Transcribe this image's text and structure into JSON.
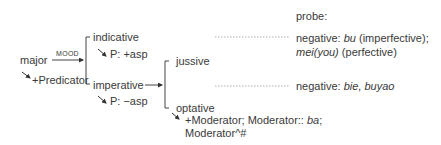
{
  "diagram": {
    "root": {
      "label": "major",
      "realization": "+Predicator",
      "system_name": "MOOD"
    },
    "mood_options": [
      {
        "label": "indicative",
        "realization": "P: +asp"
      },
      {
        "label": "imperative",
        "realization": "P: −asp"
      }
    ],
    "imperative_options": [
      {
        "label": "jussive"
      },
      {
        "label": "optative",
        "realization_line1": "+Moderator; Moderator:: ",
        "realization_ba": "ba",
        "realization_semicolon": ";",
        "realization_line2": "Moderator^#"
      }
    ],
    "probe": {
      "heading": "probe:",
      "indicative": {
        "prefix": "negative: ",
        "bu": "bu",
        "bu_gloss": " (imperfective);",
        "mei": "mei(you)",
        "mei_gloss": " (perfective)"
      },
      "jussive": {
        "prefix": "negative: ",
        "forms": "bie, buyao"
      }
    }
  }
}
